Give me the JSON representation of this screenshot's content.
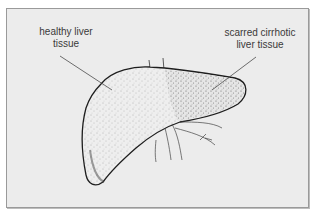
{
  "diagram": {
    "subject": "liver",
    "labels": [
      {
        "id": "healthy",
        "line1": "healthy liver",
        "line2": "tissue"
      },
      {
        "id": "scarred",
        "line1": "scarred cirrhotic",
        "line2": "liver tissue"
      }
    ],
    "colors": {
      "background": "#ececec",
      "outline": "#1e1e1e",
      "text": "#3a3a3a",
      "border": "#9a9a9a"
    }
  }
}
